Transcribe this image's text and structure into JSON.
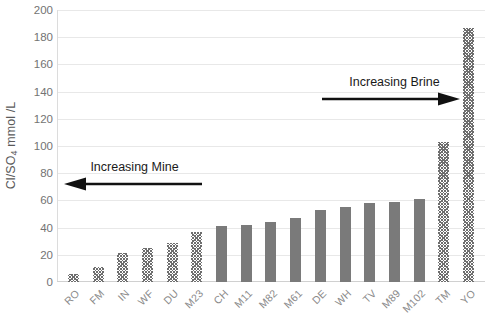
{
  "chart_data": {
    "type": "bar",
    "title": "",
    "xlabel": "",
    "ylabel": "Cl/SO4 mmol /L",
    "ylabel_parts": {
      "prefix": "Cl/SO",
      "sub": "4",
      "suffix": " mmol /L"
    },
    "ylim": [
      0,
      200
    ],
    "ytick_step": 20,
    "yticks": [
      0,
      20,
      40,
      60,
      80,
      100,
      120,
      140,
      160,
      180,
      200
    ],
    "ytick_labels": [
      "0",
      "20",
      "40",
      "60",
      "80",
      "100",
      "120",
      "140",
      "160",
      "180",
      "200"
    ],
    "grid": true,
    "grid_axis": "y",
    "legend": "none",
    "bar_color": "#7a7a7a",
    "hatch_color": "#6e6e6e",
    "gridline_color": "#e8e8e8",
    "categories": [
      "RO",
      "FM",
      "IN",
      "WF",
      "DU",
      "M23",
      "CH",
      "M11",
      "M82",
      "M61",
      "DE",
      "WH",
      "TV",
      "M89",
      "M102",
      "TM",
      "YO"
    ],
    "values": [
      6,
      11,
      21,
      25,
      29,
      37,
      41,
      42,
      44,
      47,
      53,
      55,
      58,
      59,
      61,
      103,
      187
    ],
    "bar_styles": [
      "hatched",
      "hatched",
      "hatched",
      "hatched",
      "hatched",
      "hatched",
      "solid",
      "solid",
      "solid",
      "solid",
      "solid",
      "solid",
      "solid",
      "solid",
      "solid",
      "hatched",
      "hatched"
    ],
    "annotations": [
      {
        "id": "increasing-mine",
        "text": "Increasing Mine",
        "arrow_direction": "left"
      },
      {
        "id": "increasing-brine",
        "text": "Increasing Brine",
        "arrow_direction": "right"
      }
    ]
  }
}
